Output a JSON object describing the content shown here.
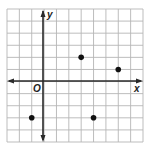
{
  "diagram": {
    "type": "coordinate-grid",
    "labels": {
      "x_axis": "x",
      "y_axis": "y",
      "origin": "O"
    },
    "grid": {
      "columns": 11,
      "rows": 11,
      "x_min": -3,
      "x_max": 8,
      "y_min": -5,
      "y_max": 6
    },
    "points": [
      {
        "x": 3,
        "y": 2
      },
      {
        "x": 6,
        "y": 1
      },
      {
        "x": -1,
        "y": -3
      },
      {
        "x": 4,
        "y": -3
      }
    ],
    "colors": {
      "grid": "#b5b5b5",
      "axis": "#2a2a2a",
      "point": "#111111"
    }
  }
}
